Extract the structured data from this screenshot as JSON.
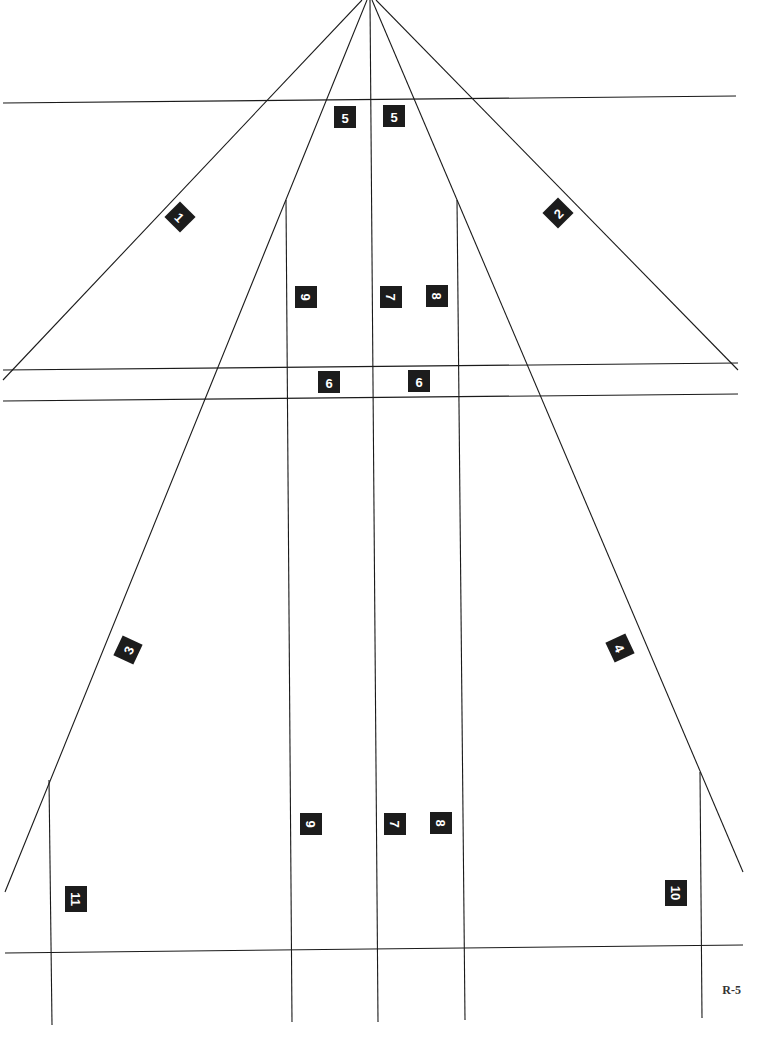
{
  "page_label": "R-5",
  "lines": [
    {
      "id": "ray-1",
      "x1": 362,
      "y1": 0,
      "x2": 3,
      "y2": 380
    },
    {
      "id": "ray-2",
      "x1": 376,
      "y1": 0,
      "x2": 738,
      "y2": 370
    },
    {
      "id": "ray-3",
      "x1": 367,
      "y1": 0,
      "x2": 5,
      "y2": 892
    },
    {
      "id": "ray-4",
      "x1": 372,
      "y1": 0,
      "x2": 743,
      "y2": 872
    },
    {
      "id": "center",
      "x1": 370,
      "y1": 0,
      "x2": 378,
      "y2": 1022
    },
    {
      "id": "h-top",
      "x1": 3,
      "y1": 103,
      "x2": 736,
      "y2": 96
    },
    {
      "id": "h-mid1",
      "x1": 3,
      "y1": 370,
      "x2": 738,
      "y2": 363
    },
    {
      "id": "h-mid2",
      "x1": 3,
      "y1": 401,
      "x2": 738,
      "y2": 394
    },
    {
      "id": "h-bottom",
      "x1": 5,
      "y1": 953,
      "x2": 743,
      "y2": 945
    },
    {
      "id": "v-left-inner",
      "x1": 286,
      "y1": 200,
      "x2": 292,
      "y2": 1022
    },
    {
      "id": "v-right-inner",
      "x1": 457,
      "y1": 200,
      "x2": 465,
      "y2": 1020
    },
    {
      "id": "v-left-outer",
      "x1": 49,
      "y1": 780,
      "x2": 52,
      "y2": 1025
    },
    {
      "id": "v-right-outer",
      "x1": 700,
      "y1": 772,
      "x2": 702,
      "y2": 1018
    }
  ],
  "badges": [
    {
      "label": "5",
      "x": 345,
      "y": 117,
      "rot": 0
    },
    {
      "label": "5",
      "x": 394,
      "y": 116,
      "rot": 0
    },
    {
      "label": "1",
      "x": 180,
      "y": 217,
      "rot": 45
    },
    {
      "label": "2",
      "x": 558,
      "y": 213,
      "rot": -45
    },
    {
      "label": "9",
      "x": 306,
      "y": 297,
      "rot": 90
    },
    {
      "label": "7",
      "x": 391,
      "y": 297,
      "rot": 90
    },
    {
      "label": "8",
      "x": 437,
      "y": 296,
      "rot": 90
    },
    {
      "label": "6",
      "x": 329,
      "y": 382,
      "rot": 0
    },
    {
      "label": "6",
      "x": 419,
      "y": 381,
      "rot": 0
    },
    {
      "label": "3",
      "x": 128,
      "y": 650,
      "rot": -65
    },
    {
      "label": "4",
      "x": 620,
      "y": 648,
      "rot": 65
    },
    {
      "label": "9",
      "x": 311,
      "y": 824,
      "rot": 90
    },
    {
      "label": "7",
      "x": 395,
      "y": 824,
      "rot": 90
    },
    {
      "label": "8",
      "x": 441,
      "y": 823,
      "rot": 90
    },
    {
      "label": "11",
      "x": 76,
      "y": 899,
      "rot": 90
    },
    {
      "label": "10",
      "x": 676,
      "y": 893,
      "rot": 90
    }
  ]
}
